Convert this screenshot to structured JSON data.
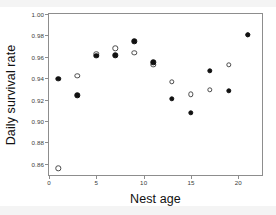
{
  "figure": {
    "background_color": "#ffffff",
    "frame_color": "#8d8d8d"
  },
  "chart_data": {
    "type": "scatter",
    "title": "",
    "xlabel": "Nest age",
    "ylabel": "Daily survival rate",
    "xlim": [
      0,
      22.5
    ],
    "ylim": [
      0.8495,
      1.0
    ],
    "xticks": [
      "0",
      "5",
      "10",
      "15",
      "20"
    ],
    "xtick_values": [
      0,
      5,
      10,
      15,
      20
    ],
    "yticks": [
      "0.86",
      "0.88",
      "0.90",
      "0.92",
      "0.94",
      "0.96",
      "0.98",
      "1.00"
    ],
    "ytick_values": [
      0.86,
      0.88,
      0.9,
      0.92,
      0.94,
      0.96,
      0.98,
      1.0
    ],
    "grid": false,
    "legend": "none",
    "series": [
      {
        "name": "filled-circles",
        "marker": "filled circle",
        "color": "#111111",
        "x": [
          1,
          3,
          5,
          7,
          9,
          11,
          13,
          15,
          17,
          19,
          21
        ],
        "y": [
          0.9395,
          0.924,
          0.9612,
          0.9613,
          0.9745,
          0.9547,
          0.921,
          0.9075,
          0.947,
          0.9282,
          0.9805
        ]
      },
      {
        "name": "open-circles",
        "marker": "open circle",
        "color": "#4a4a4a",
        "x": [
          1,
          3,
          5,
          7,
          9,
          11,
          13,
          15,
          17,
          19,
          21
        ],
        "y": [
          0.8558,
          0.942,
          0.963,
          0.968,
          0.9635,
          0.9525,
          0.9365,
          0.9248,
          0.9292,
          0.9527,
          0.9808
        ]
      }
    ]
  }
}
